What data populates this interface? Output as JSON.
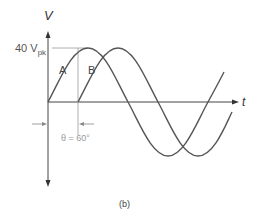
{
  "figure": {
    "axis_y_label": "V",
    "axis_x_label": "t",
    "peak_label_value": "40 V",
    "peak_label_sub": "pk",
    "curve_a_label": "A",
    "curve_b_label": "B",
    "phase_label": "θ = 60°",
    "caption": "(b)"
  },
  "colors": {
    "curve": "#555555",
    "axis": "#444444",
    "guide": "#999999"
  }
}
